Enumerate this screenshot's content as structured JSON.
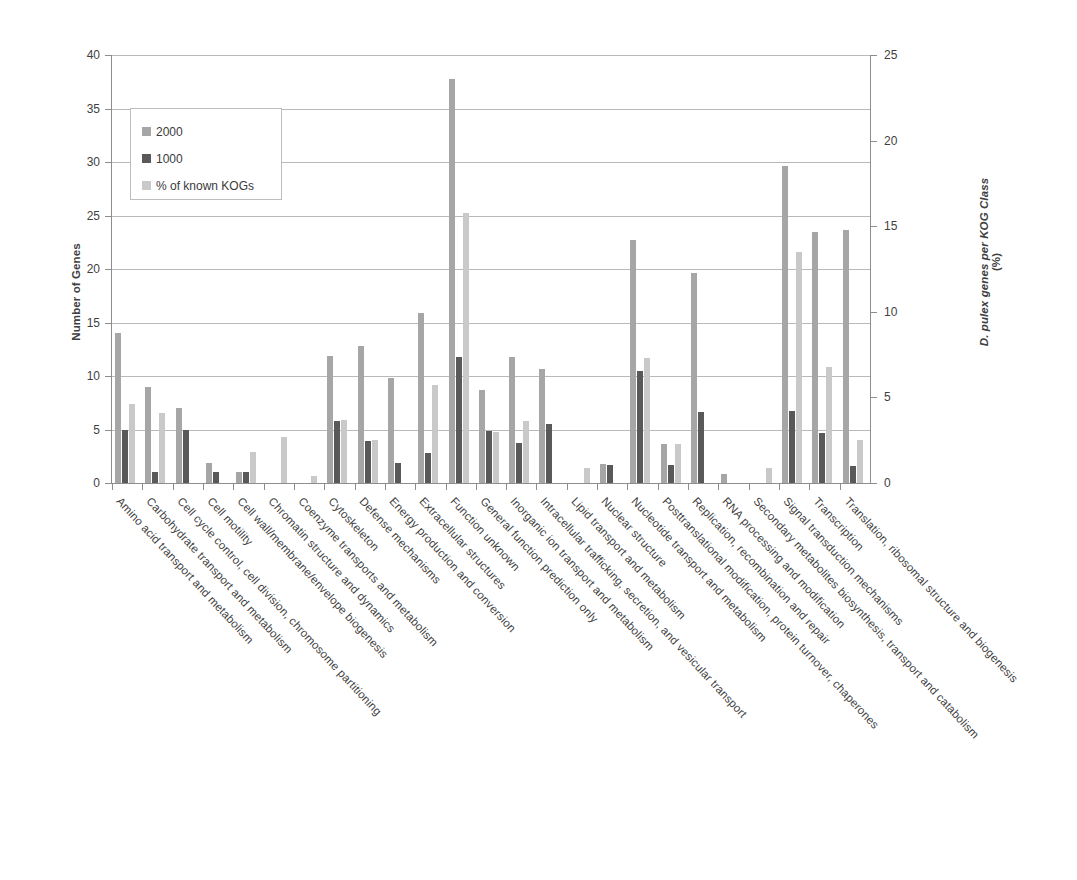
{
  "chart_data": {
    "type": "bar",
    "title": "",
    "xlabel": "",
    "ylabel": "Number of Genes",
    "ylabel_right_italic": "D. pulex",
    "ylabel_right_rest": " genes per KOG Class",
    "ylabel_right_unit": "(%)",
    "ylim": [
      0,
      40
    ],
    "ylim_right": [
      0,
      25
    ],
    "ytick_step": 5,
    "ytick_step_right": 5,
    "yticks": [
      "0",
      "5",
      "10",
      "15",
      "20",
      "25",
      "30",
      "35",
      "40"
    ],
    "yticks_right": [
      "0",
      "5",
      "10",
      "15",
      "20",
      "25"
    ],
    "grid": true,
    "legend_position": "upper-left",
    "colors": {
      "series_2000": "#a6a6a6",
      "series_1000": "#595959",
      "series_percent": "#c9c9c9",
      "gridline": "#b9b9b9",
      "axis": "#8d8d8d",
      "text": "#3f3f3f",
      "background": "#ffffff"
    },
    "categories": [
      "Amino acid transport and metabolism",
      "Carbohydrate transport and metabolism",
      "Cell cycle control, cell division, chromosome partitioning",
      "Cell motility",
      "Cell wall/membrane/envelope biogenesis",
      "Chromatin structure and dynamics",
      "Coenzyme transports and metabolism",
      "Cytoskeleton",
      "Defense mechanisms",
      "Energy production and conversion",
      "Extracellular structures",
      "Function unknown",
      "General function prediction only",
      "Inorganic ion transport and metabolism",
      "Intracellular trafficking, secretion, and vesicular transport",
      "Lipid transport and metabolism",
      "Nuclear structure",
      "Nucleotide transport and metabolism",
      "Posttranslational modification, protein turnover, chaperones",
      "Replication, recombination and repair",
      "RNA processing and modification",
      "Secondary metabolites biosynthesis, transport and catabolism",
      "Signal transduction mechanisms",
      "Transcription",
      "Translation, ribosomal structure and biogenesis"
    ],
    "series": [
      {
        "name": "2000",
        "axis": "left",
        "color": "#a6a6a6",
        "values": [
          14.0,
          9.0,
          7.0,
          1.9,
          1.0,
          0.0,
          0.0,
          11.9,
          12.8,
          9.8,
          15.9,
          37.8,
          8.7,
          11.8,
          10.7,
          0.0,
          1.8,
          22.7,
          3.6,
          19.6,
          0.8,
          0.0,
          29.6,
          23.5,
          23.6
        ]
      },
      {
        "name": "1000",
        "axis": "left",
        "color": "#595959",
        "values": [
          5.0,
          1.0,
          5.0,
          1.0,
          1.0,
          0.0,
          0.0,
          5.8,
          3.9,
          1.9,
          2.8,
          11.8,
          4.9,
          3.7,
          5.5,
          0.0,
          1.7,
          10.5,
          1.7,
          6.6,
          0.0,
          0.0,
          6.7,
          4.7,
          1.6
        ]
      },
      {
        "name": "% of known KOGs",
        "axis": "right",
        "color": "#c9c9c9",
        "values": [
          4.6,
          4.1,
          0.0,
          0.0,
          1.8,
          2.7,
          0.4,
          3.7,
          2.5,
          0.0,
          5.7,
          15.8,
          3.0,
          3.6,
          0.0,
          0.9,
          0.0,
          7.3,
          2.3,
          0.0,
          0.0,
          0.9,
          13.5,
          6.8,
          2.5
        ]
      }
    ],
    "legend": [
      {
        "label": "2000",
        "color": "#a6a6a6"
      },
      {
        "label": "1000",
        "color": "#595959"
      },
      {
        "label": "% of known KOGs",
        "color": "#c9c9c9"
      }
    ]
  }
}
